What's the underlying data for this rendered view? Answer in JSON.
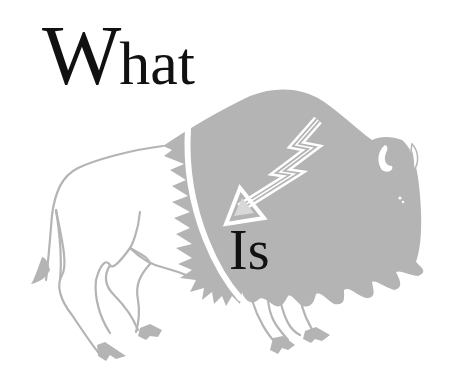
{
  "heading": {
    "word1_initial": "W",
    "word1_rest": "hat",
    "word2": "Is"
  },
  "illustration": {
    "subject": "bison-with-heartline-arrow",
    "colors": {
      "fill": "#b4b4b4",
      "outline": "#b4b4b4",
      "background": "#ffffff",
      "text": "#111111",
      "highlight": "#ffffff"
    }
  }
}
